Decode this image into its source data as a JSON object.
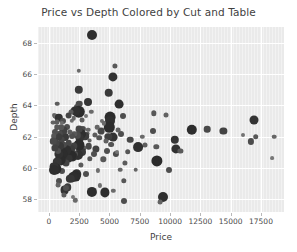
{
  "chart_data": {
    "type": "scatter",
    "title": "Price vs Depth Colored by Cut and Table",
    "xlabel": "Price",
    "ylabel": "Depth",
    "xlim": [
      -900,
      19400
    ],
    "ylim": [
      57.2,
      69.0
    ],
    "xticks": [
      0,
      2500,
      5000,
      7500,
      10000,
      12500,
      15000,
      17500
    ],
    "xticklabels": [
      "0",
      "2500",
      "5000",
      "7500",
      "10000",
      "12500",
      "15000",
      "17500"
    ],
    "yticks": [
      58,
      60,
      62,
      64,
      66,
      68
    ],
    "yticklabels": [
      "58",
      "60",
      "62",
      "64",
      "66",
      "68"
    ],
    "grid": true,
    "legend": "none",
    "style": "darkgrid",
    "size_encodes": "table",
    "color_encodes": "cut",
    "palette": [
      "#2b2b2b",
      "#3d3d3d",
      "#555555",
      "#6e6e6e",
      "#8a8a8a",
      "#a3a3a3"
    ],
    "points": [
      {
        "x": 3580,
        "y": 68.5,
        "s": 5.0,
        "c": "#2f2f2f"
      },
      {
        "x": 5450,
        "y": 66.5,
        "s": 2.6,
        "c": "#585858"
      },
      {
        "x": 5250,
        "y": 65.8,
        "s": 4.6,
        "c": "#333333"
      },
      {
        "x": 2480,
        "y": 66.2,
        "s": 2.2,
        "c": "#6b6b6b"
      },
      {
        "x": 2450,
        "y": 65.0,
        "s": 4.2,
        "c": "#3a3a3a"
      },
      {
        "x": 4950,
        "y": 64.8,
        "s": 4.3,
        "c": "#3a3a3a"
      },
      {
        "x": 5800,
        "y": 64.1,
        "s": 4.4,
        "c": "#2e2e2e"
      },
      {
        "x": 3250,
        "y": 64.2,
        "s": 4.0,
        "c": "#353535"
      },
      {
        "x": 2520,
        "y": 64.1,
        "s": 3.3,
        "c": "#4a4a4a"
      },
      {
        "x": 700,
        "y": 64.1,
        "s": 2.3,
        "c": "#5d5d5d"
      },
      {
        "x": 2320,
        "y": 63.9,
        "s": 3.0,
        "c": "#4f4f4f"
      },
      {
        "x": 3500,
        "y": 63.6,
        "s": 2.2,
        "c": "#6a6a6a"
      },
      {
        "x": 2450,
        "y": 63.6,
        "s": 6.2,
        "c": "#2b2b2b"
      },
      {
        "x": 2180,
        "y": 63.65,
        "s": 4.6,
        "c": "#303030"
      },
      {
        "x": 1820,
        "y": 63.55,
        "s": 2.5,
        "c": "#5a5a5a"
      },
      {
        "x": 6100,
        "y": 63.3,
        "s": 3.0,
        "c": "#4e4e4e"
      },
      {
        "x": 5050,
        "y": 63.25,
        "s": 5.4,
        "c": "#2c2c2c"
      },
      {
        "x": 5080,
        "y": 63.0,
        "s": 5.0,
        "c": "#303030"
      },
      {
        "x": 440,
        "y": 63.4,
        "s": 2.0,
        "c": "#6f6f6f"
      },
      {
        "x": 480,
        "y": 63.3,
        "s": 2.4,
        "c": "#626262"
      },
      {
        "x": 560,
        "y": 63.3,
        "s": 2.1,
        "c": "#6b6b6b"
      },
      {
        "x": 820,
        "y": 63.2,
        "s": 4.2,
        "c": "#333333"
      },
      {
        "x": 1150,
        "y": 63.0,
        "s": 3.0,
        "c": "#505050"
      },
      {
        "x": 8680,
        "y": 63.5,
        "s": 2.7,
        "c": "#585858"
      },
      {
        "x": 9700,
        "y": 63.4,
        "s": 2.5,
        "c": "#616161"
      },
      {
        "x": 16900,
        "y": 63.05,
        "s": 4.5,
        "c": "#333333"
      },
      {
        "x": 11800,
        "y": 62.45,
        "s": 5.2,
        "c": "#2d2d2d"
      },
      {
        "x": 13050,
        "y": 62.5,
        "s": 3.3,
        "c": "#4a4a4a"
      },
      {
        "x": 14400,
        "y": 62.35,
        "s": 3.6,
        "c": "#434343"
      },
      {
        "x": 16000,
        "y": 62.1,
        "s": 2.0,
        "c": "#737373"
      },
      {
        "x": 17050,
        "y": 62.0,
        "s": 2.8,
        "c": "#575757"
      },
      {
        "x": 18600,
        "y": 62.0,
        "s": 2.3,
        "c": "#666666"
      },
      {
        "x": 16650,
        "y": 61.7,
        "s": 3.1,
        "c": "#4c4c4c"
      },
      {
        "x": 18450,
        "y": 60.65,
        "s": 1.9,
        "c": "#777777"
      },
      {
        "x": 10400,
        "y": 61.8,
        "s": 4.2,
        "c": "#353535"
      },
      {
        "x": 10500,
        "y": 61.25,
        "s": 4.6,
        "c": "#303030"
      },
      {
        "x": 10850,
        "y": 61.1,
        "s": 2.6,
        "c": "#5a5a5a"
      },
      {
        "x": 9950,
        "y": 59.9,
        "s": 3.0,
        "c": "#4e4e4e"
      },
      {
        "x": 9400,
        "y": 58.15,
        "s": 5.0,
        "c": "#2e2e2e"
      },
      {
        "x": 9200,
        "y": 57.85,
        "s": 2.4,
        "c": "#636363"
      },
      {
        "x": 8900,
        "y": 60.45,
        "s": 5.6,
        "c": "#2b2b2b"
      },
      {
        "x": 8850,
        "y": 61.35,
        "s": 2.7,
        "c": "#585858"
      },
      {
        "x": 8600,
        "y": 62.35,
        "s": 3.0,
        "c": "#4e4e4e"
      },
      {
        "x": 7900,
        "y": 61.5,
        "s": 2.5,
        "c": "#5e5e5e"
      },
      {
        "x": 7700,
        "y": 62.0,
        "s": 2.2,
        "c": "#6a6a6a"
      },
      {
        "x": 7350,
        "y": 61.35,
        "s": 4.9,
        "c": "#303030"
      },
      {
        "x": 7150,
        "y": 59.9,
        "s": 2.3,
        "c": "#666666"
      },
      {
        "x": 6700,
        "y": 61.8,
        "s": 3.3,
        "c": "#494949"
      },
      {
        "x": 6500,
        "y": 61.05,
        "s": 2.8,
        "c": "#565656"
      },
      {
        "x": 6300,
        "y": 60.35,
        "s": 2.6,
        "c": "#5b5b5b"
      },
      {
        "x": 6200,
        "y": 57.9,
        "s": 3.0,
        "c": "#4d4d4d"
      },
      {
        "x": 6200,
        "y": 59.2,
        "s": 2.7,
        "c": "#575757"
      },
      {
        "x": 5950,
        "y": 62.2,
        "s": 3.0,
        "c": "#4f4f4f"
      },
      {
        "x": 5700,
        "y": 62.4,
        "s": 2.4,
        "c": "#636363"
      },
      {
        "x": 5500,
        "y": 60.9,
        "s": 3.1,
        "c": "#4b4b4b"
      },
      {
        "x": 5300,
        "y": 62.0,
        "s": 4.4,
        "c": "#333333"
      },
      {
        "x": 5150,
        "y": 61.5,
        "s": 2.9,
        "c": "#545454"
      },
      {
        "x": 5000,
        "y": 62.6,
        "s": 5.2,
        "c": "#2d2d2d"
      },
      {
        "x": 4900,
        "y": 62.0,
        "s": 3.7,
        "c": "#3f3f3f"
      },
      {
        "x": 4820,
        "y": 61.1,
        "s": 3.0,
        "c": "#4f4f4f"
      },
      {
        "x": 4700,
        "y": 61.7,
        "s": 2.5,
        "c": "#606060"
      },
      {
        "x": 4600,
        "y": 58.45,
        "s": 4.6,
        "c": "#2f2f2f"
      },
      {
        "x": 4480,
        "y": 60.55,
        "s": 2.7,
        "c": "#585858"
      },
      {
        "x": 4300,
        "y": 62.35,
        "s": 3.4,
        "c": "#454545"
      },
      {
        "x": 4150,
        "y": 61.95,
        "s": 2.8,
        "c": "#555555"
      },
      {
        "x": 4000,
        "y": 62.6,
        "s": 2.3,
        "c": "#666666"
      },
      {
        "x": 3900,
        "y": 61.2,
        "s": 3.6,
        "c": "#414141"
      },
      {
        "x": 3800,
        "y": 62.1,
        "s": 2.6,
        "c": "#5c5c5c"
      },
      {
        "x": 3700,
        "y": 60.9,
        "s": 3.0,
        "c": "#4e4e4e"
      },
      {
        "x": 3550,
        "y": 58.5,
        "s": 5.1,
        "c": "#2d2d2d"
      },
      {
        "x": 3400,
        "y": 60.6,
        "s": 2.7,
        "c": "#575757"
      },
      {
        "x": 3300,
        "y": 61.4,
        "s": 3.3,
        "c": "#484848"
      },
      {
        "x": 3200,
        "y": 62.2,
        "s": 2.4,
        "c": "#626262"
      },
      {
        "x": 3100,
        "y": 59.6,
        "s": 3.0,
        "c": "#4e4e4e"
      },
      {
        "x": 3000,
        "y": 62.05,
        "s": 3.8,
        "c": "#3d3d3d"
      },
      {
        "x": 2900,
        "y": 61.3,
        "s": 2.6,
        "c": "#5a5a5a"
      },
      {
        "x": 2800,
        "y": 62.5,
        "s": 3.1,
        "c": "#4c4c4c"
      },
      {
        "x": 2700,
        "y": 61.0,
        "s": 4.0,
        "c": "#383838"
      },
      {
        "x": 2620,
        "y": 62.2,
        "s": 5.0,
        "c": "#2f2f2f"
      },
      {
        "x": 2550,
        "y": 61.9,
        "s": 4.3,
        "c": "#353535"
      },
      {
        "x": 2500,
        "y": 62.5,
        "s": 3.4,
        "c": "#454545"
      },
      {
        "x": 2450,
        "y": 61.5,
        "s": 5.5,
        "c": "#2b2b2b"
      },
      {
        "x": 2400,
        "y": 60.85,
        "s": 5.0,
        "c": "#303030"
      },
      {
        "x": 2350,
        "y": 62.1,
        "s": 3.2,
        "c": "#4a4a4a"
      },
      {
        "x": 2300,
        "y": 59.6,
        "s": 4.8,
        "c": "#323232"
      },
      {
        "x": 2200,
        "y": 59.5,
        "s": 5.4,
        "c": "#2c2c2c"
      },
      {
        "x": 2150,
        "y": 60.9,
        "s": 3.0,
        "c": "#4f4f4f"
      },
      {
        "x": 2100,
        "y": 62.2,
        "s": 2.7,
        "c": "#585858"
      },
      {
        "x": 2050,
        "y": 61.4,
        "s": 3.6,
        "c": "#414141"
      },
      {
        "x": 2000,
        "y": 60.75,
        "s": 4.6,
        "c": "#303030"
      },
      {
        "x": 1950,
        "y": 59.45,
        "s": 5.0,
        "c": "#2e2e2e"
      },
      {
        "x": 1900,
        "y": 62.05,
        "s": 3.0,
        "c": "#4e4e4e"
      },
      {
        "x": 1850,
        "y": 61.2,
        "s": 3.9,
        "c": "#3b3b3b"
      },
      {
        "x": 1800,
        "y": 60.8,
        "s": 5.8,
        "c": "#2a2a2a"
      },
      {
        "x": 1750,
        "y": 59.3,
        "s": 4.2,
        "c": "#363636"
      },
      {
        "x": 1700,
        "y": 62.3,
        "s": 2.6,
        "c": "#5b5b5b"
      },
      {
        "x": 1650,
        "y": 61.6,
        "s": 3.3,
        "c": "#474747"
      },
      {
        "x": 1600,
        "y": 60.6,
        "s": 4.4,
        "c": "#333333"
      },
      {
        "x": 1550,
        "y": 58.8,
        "s": 3.8,
        "c": "#3d3d3d"
      },
      {
        "x": 1500,
        "y": 62.6,
        "s": 3.0,
        "c": "#4f4f4f"
      },
      {
        "x": 1450,
        "y": 61.15,
        "s": 4.8,
        "c": "#2f2f2f"
      },
      {
        "x": 1400,
        "y": 60.3,
        "s": 3.5,
        "c": "#434343"
      },
      {
        "x": 1350,
        "y": 62.0,
        "s": 4.0,
        "c": "#393939"
      },
      {
        "x": 1300,
        "y": 58.6,
        "s": 4.4,
        "c": "#333333"
      },
      {
        "x": 1250,
        "y": 61.5,
        "s": 3.2,
        "c": "#4a4a4a"
      },
      {
        "x": 1200,
        "y": 62.4,
        "s": 3.6,
        "c": "#414141"
      },
      {
        "x": 1150,
        "y": 60.9,
        "s": 5.2,
        "c": "#2d2d2d"
      },
      {
        "x": 1100,
        "y": 59.8,
        "s": 3.0,
        "c": "#4e4e4e"
      },
      {
        "x": 1050,
        "y": 61.8,
        "s": 3.4,
        "c": "#454545"
      },
      {
        "x": 1000,
        "y": 62.6,
        "s": 2.8,
        "c": "#565656"
      },
      {
        "x": 950,
        "y": 60.5,
        "s": 5.4,
        "c": "#2c2c2c"
      },
      {
        "x": 900,
        "y": 61.4,
        "s": 4.0,
        "c": "#393939"
      },
      {
        "x": 880,
        "y": 62.2,
        "s": 3.2,
        "c": "#4a4a4a"
      },
      {
        "x": 850,
        "y": 59.2,
        "s": 3.0,
        "c": "#4f4f4f"
      },
      {
        "x": 800,
        "y": 60.9,
        "s": 4.6,
        "c": "#313131"
      },
      {
        "x": 760,
        "y": 62.0,
        "s": 3.8,
        "c": "#3c3c3c"
      },
      {
        "x": 720,
        "y": 61.1,
        "s": 3.0,
        "c": "#4e4e4e"
      },
      {
        "x": 680,
        "y": 60.4,
        "s": 4.2,
        "c": "#363636"
      },
      {
        "x": 640,
        "y": 62.6,
        "s": 2.7,
        "c": "#585858"
      },
      {
        "x": 600,
        "y": 61.6,
        "s": 3.4,
        "c": "#444444"
      },
      {
        "x": 560,
        "y": 59.95,
        "s": 5.6,
        "c": "#2b2b2b"
      },
      {
        "x": 520,
        "y": 62.3,
        "s": 3.0,
        "c": "#4f4f4f"
      },
      {
        "x": 480,
        "y": 61.3,
        "s": 3.6,
        "c": "#404040"
      },
      {
        "x": 440,
        "y": 60.1,
        "s": 4.4,
        "c": "#333333"
      },
      {
        "x": 400,
        "y": 62.05,
        "s": 2.8,
        "c": "#555555"
      },
      {
        "x": 380,
        "y": 59.9,
        "s": 5.0,
        "c": "#2e2e2e"
      },
      {
        "x": 360,
        "y": 61.7,
        "s": 3.2,
        "c": "#494949"
      },
      {
        "x": 340,
        "y": 62.9,
        "s": 2.4,
        "c": "#636363"
      },
      {
        "x": 1620,
        "y": 63.35,
        "s": 3.4,
        "c": "#464646"
      },
      {
        "x": 1900,
        "y": 63.0,
        "s": 2.2,
        "c": "#6c6c6c"
      },
      {
        "x": 2750,
        "y": 63.1,
        "s": 2.5,
        "c": "#5f5f5f"
      },
      {
        "x": 3250,
        "y": 62.45,
        "s": 2.3,
        "c": "#686868"
      },
      {
        "x": 4400,
        "y": 63.0,
        "s": 2.1,
        "c": "#707070"
      },
      {
        "x": 3050,
        "y": 63.3,
        "s": 2.0,
        "c": "#757575"
      },
      {
        "x": 2180,
        "y": 57.95,
        "s": 2.2,
        "c": "#6a6a6a"
      },
      {
        "x": 1250,
        "y": 58.3,
        "s": 2.6,
        "c": "#5c5c5c"
      },
      {
        "x": 1420,
        "y": 58.75,
        "s": 3.0,
        "c": "#4f4f4f"
      },
      {
        "x": 780,
        "y": 58.9,
        "s": 2.4,
        "c": "#646464"
      },
      {
        "x": 5900,
        "y": 59.9,
        "s": 2.3,
        "c": "#666666"
      },
      {
        "x": 4050,
        "y": 59.85,
        "s": 2.1,
        "c": "#6e6e6e"
      },
      {
        "x": 2650,
        "y": 60.2,
        "s": 2.6,
        "c": "#5b5b5b"
      },
      {
        "x": 3350,
        "y": 61.75,
        "s": 2.4,
        "c": "#626262"
      },
      {
        "x": 4550,
        "y": 62.85,
        "s": 2.2,
        "c": "#6a6a6a"
      },
      {
        "x": 5600,
        "y": 61.0,
        "s": 2.0,
        "c": "#747474"
      },
      {
        "x": 2050,
        "y": 63.2,
        "s": 2.3,
        "c": "#676767"
      },
      {
        "x": 1100,
        "y": 62.9,
        "s": 2.1,
        "c": "#6e6e6e"
      },
      {
        "x": 650,
        "y": 62.95,
        "s": 2.5,
        "c": "#5e5e5e"
      },
      {
        "x": 1950,
        "y": 58.15,
        "s": 2.0,
        "c": "#767676"
      },
      {
        "x": 5300,
        "y": 58.55,
        "s": 2.2,
        "c": "#6b6b6b"
      },
      {
        "x": 4200,
        "y": 58.9,
        "s": 2.1,
        "c": "#6f6f6f"
      }
    ]
  }
}
